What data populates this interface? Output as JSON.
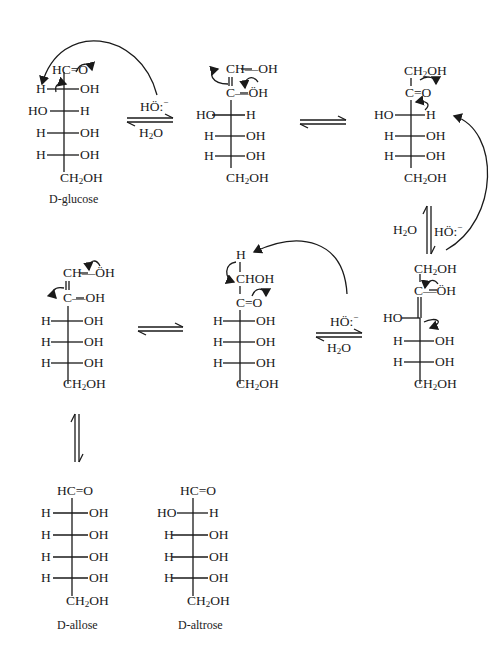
{
  "molecules": {
    "glucose": {
      "top": "HC=O",
      "rows": [
        [
          "H",
          "OH"
        ],
        [
          "HO",
          "H"
        ],
        [
          "H",
          "OH"
        ],
        [
          "H",
          "OH"
        ]
      ],
      "bottom": "CH2OH",
      "caption_prefix": "D",
      "caption": "-glucose"
    },
    "enediol_1": {
      "top": "CH—OH",
      "c2": "C—ÖH",
      "rows": [
        [
          "HO",
          "H"
        ],
        [
          "H",
          "OH"
        ],
        [
          "H",
          "OH"
        ]
      ],
      "bottom": "CH2OH"
    },
    "fructose": {
      "top": "CH2OH",
      "c2": "C=O",
      "rows": [
        [
          "HO",
          "H"
        ],
        [
          "H",
          "OH"
        ],
        [
          "H",
          "OH"
        ]
      ],
      "bottom": "CH2OH"
    },
    "enediol_2": {
      "top": "CH2OH",
      "c2": "C—ÖH",
      "c3_left": "HO",
      "rows": [
        [
          "H",
          "OH"
        ],
        [
          "H",
          "OH"
        ]
      ],
      "bottom": "CH2OH"
    },
    "ketose_3": {
      "h_top": "H",
      "top": "CHOH",
      "c2": "C=O",
      "rows": [
        [
          "H",
          "OH"
        ],
        [
          "H",
          "OH"
        ],
        [
          "H",
          "OH"
        ]
      ],
      "bottom": "CH2OH"
    },
    "enediol_3": {
      "top": "CH—ÖH",
      "c2": "C—OH",
      "rows": [
        [
          "H",
          "OH"
        ],
        [
          "H",
          "OH"
        ],
        [
          "H",
          "OH"
        ]
      ],
      "bottom": "CH2OH"
    },
    "allose": {
      "top": "HC=O",
      "rows": [
        [
          "H",
          "OH"
        ],
        [
          "H",
          "OH"
        ],
        [
          "H",
          "OH"
        ],
        [
          "H",
          "OH"
        ]
      ],
      "bottom": "CH2OH",
      "caption_prefix": "D",
      "caption": "-allose"
    },
    "altrose": {
      "top": "HC=O",
      "rows": [
        [
          "HO",
          "H"
        ],
        [
          "H",
          "OH"
        ],
        [
          "H",
          "OH"
        ],
        [
          "H",
          "OH"
        ]
      ],
      "bottom": "CH2OH",
      "caption_prefix": "D",
      "caption": "-altrose"
    }
  },
  "reagents": {
    "base": "HÖ:",
    "base_charge": "−",
    "water": "H2O"
  },
  "colors": {
    "ink": "#1a1a1a",
    "background": "#ffffff"
  }
}
